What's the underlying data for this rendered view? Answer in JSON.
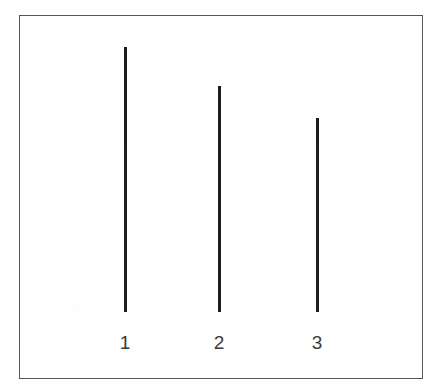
{
  "figure": {
    "kind": "line-height-bar-figure",
    "background_color": "#ffffff",
    "frame": {
      "name": "plot-frame",
      "color": "#55565a",
      "stroke_width_px": 1.5,
      "left_px": 19,
      "top_px": 15,
      "width_px": 404,
      "height_px": 364
    },
    "baseline_y_px": 312,
    "line_color": "#1d1d1f",
    "line_width_px": 3,
    "label_color": "#3a3a3c",
    "label_font_size_px": 19,
    "label_baseline_y_px": 352
  },
  "chart_data": {
    "type": "bar",
    "title": "",
    "subtitle": "",
    "xlabel": "",
    "ylabel": "",
    "grid": false,
    "legend": null,
    "categories": [
      "1",
      "2",
      "3"
    ],
    "values": [
      265,
      226,
      194
    ],
    "value_units": "px",
    "ylim": [
      0,
      297
    ],
    "series": [
      {
        "name": "line-height",
        "values": [
          265,
          226,
          194
        ]
      }
    ],
    "annotations": [],
    "points": [
      {
        "label": "1",
        "x_px": 125,
        "top_y_px": 47,
        "bottom_y_px": 312,
        "height_px": 265
      },
      {
        "label": "2",
        "x_px": 219,
        "top_y_px": 86,
        "bottom_y_px": 312,
        "height_px": 226
      },
      {
        "label": "3",
        "x_px": 317,
        "top_y_px": 118,
        "bottom_y_px": 312,
        "height_px": 194
      }
    ]
  },
  "labels": {
    "items": [
      {
        "text": "1",
        "center_x_px": 125
      },
      {
        "text": "2",
        "center_x_px": 219
      },
      {
        "text": "3",
        "center_x_px": 317
      }
    ]
  }
}
